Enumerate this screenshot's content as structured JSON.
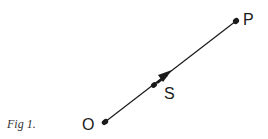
{
  "caption": "Fig 1.",
  "points": {
    "O": {
      "label": "O"
    },
    "S": {
      "label": "S"
    },
    "P": {
      "label": "P"
    }
  },
  "colors": {
    "ink": "#1a1a1a",
    "background": "#ffffff"
  }
}
